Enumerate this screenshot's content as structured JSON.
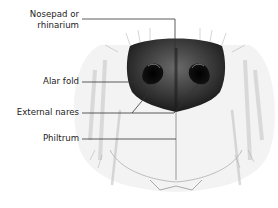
{
  "figure": {
    "labels": [
      {
        "id": "nosepad",
        "line1": "Nosepad or",
        "line2": "rhinarium"
      },
      {
        "id": "alar-fold",
        "line1": "Alar fold"
      },
      {
        "id": "external-nares",
        "line1": "External nares"
      },
      {
        "id": "philtrum",
        "line1": "Philtrum"
      }
    ]
  },
  "colors": {
    "nose": "#2b2b2b",
    "leader_line": "#333333",
    "fur_shade": "#cfcfcf"
  }
}
